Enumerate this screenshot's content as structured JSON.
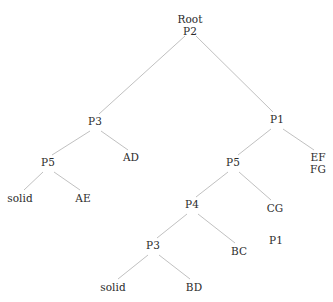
{
  "diagram": {
    "type": "tree",
    "background_color": "#ffffff",
    "edge_color": "#b0b0b0",
    "text_color": "#2b2b2b",
    "width": 333,
    "height": 302
  },
  "nodes": [
    {
      "id": "root",
      "label": "Root",
      "label2": "P2",
      "x": 190,
      "y": 14,
      "kind": "root"
    },
    {
      "id": "p3-left",
      "label": "P3",
      "label2": "",
      "x": 95,
      "y": 116,
      "kind": "internal"
    },
    {
      "id": "p1-right",
      "label": "P1",
      "label2": "",
      "x": 277,
      "y": 114,
      "kind": "internal"
    },
    {
      "id": "p5-left",
      "label": "P5",
      "label2": "",
      "x": 48,
      "y": 157,
      "kind": "internal"
    },
    {
      "id": "ad-leaf",
      "label": "AD",
      "label2": "",
      "x": 131,
      "y": 152,
      "kind": "leaf"
    },
    {
      "id": "solid-left",
      "label": "solid",
      "label2": "",
      "x": 20,
      "y": 193,
      "kind": "leaf"
    },
    {
      "id": "ae-leaf",
      "label": "AE",
      "label2": "",
      "x": 83,
      "y": 193,
      "kind": "leaf"
    },
    {
      "id": "p5-right",
      "label": "P5",
      "label2": "",
      "x": 233,
      "y": 157,
      "kind": "internal"
    },
    {
      "id": "effg-leaf",
      "label": "EF",
      "label2": "FG",
      "x": 318,
      "y": 152,
      "kind": "leaf"
    },
    {
      "id": "p4-node",
      "label": "P4",
      "label2": "",
      "x": 192,
      "y": 199,
      "kind": "internal"
    },
    {
      "id": "cg-leaf",
      "label": "CG",
      "label2": "",
      "x": 275,
      "y": 203,
      "kind": "leaf"
    },
    {
      "id": "p3-lower",
      "label": "P3",
      "label2": "",
      "x": 153,
      "y": 240,
      "kind": "internal"
    },
    {
      "id": "bc-leaf",
      "label": "BC",
      "label2": "",
      "x": 239,
      "y": 246,
      "kind": "leaf"
    },
    {
      "id": "p1-floating",
      "label": "P1",
      "label2": "",
      "x": 276,
      "y": 235,
      "kind": "detached"
    },
    {
      "id": "solid-lower",
      "label": "solid",
      "label2": "",
      "x": 113,
      "y": 282,
      "kind": "leaf"
    },
    {
      "id": "bd-leaf",
      "label": "BD",
      "label2": "",
      "x": 194,
      "y": 282,
      "kind": "leaf"
    }
  ],
  "edges": [
    {
      "from": "root",
      "to": "p3-left",
      "x1": 185,
      "y1": 36,
      "x2": 99,
      "y2": 114
    },
    {
      "from": "root",
      "to": "p1-right",
      "x1": 196,
      "y1": 36,
      "x2": 273,
      "y2": 112
    },
    {
      "from": "p3-left",
      "to": "p5-left",
      "x1": 90,
      "y1": 131,
      "x2": 52,
      "y2": 155
    },
    {
      "from": "p3-left",
      "to": "ad-leaf",
      "x1": 101,
      "y1": 131,
      "x2": 128,
      "y2": 150
    },
    {
      "from": "p5-left",
      "to": "solid-left",
      "x1": 43,
      "y1": 172,
      "x2": 24,
      "y2": 190
    },
    {
      "from": "p5-left",
      "to": "ae-leaf",
      "x1": 54,
      "y1": 172,
      "x2": 80,
      "y2": 190
    },
    {
      "from": "p1-right",
      "to": "p5-right",
      "x1": 271,
      "y1": 129,
      "x2": 238,
      "y2": 155
    },
    {
      "from": "p1-right",
      "to": "effg-leaf",
      "x1": 283,
      "y1": 129,
      "x2": 314,
      "y2": 150
    },
    {
      "from": "p5-right",
      "to": "p4-node",
      "x1": 228,
      "y1": 172,
      "x2": 196,
      "y2": 197
    },
    {
      "from": "p5-right",
      "to": "cg-leaf",
      "x1": 239,
      "y1": 172,
      "x2": 271,
      "y2": 200
    },
    {
      "from": "p4-node",
      "to": "p3-lower",
      "x1": 187,
      "y1": 214,
      "x2": 157,
      "y2": 238
    },
    {
      "from": "p4-node",
      "to": "bc-leaf",
      "x1": 198,
      "y1": 214,
      "x2": 235,
      "y2": 243
    },
    {
      "from": "p3-lower",
      "to": "solid-lower",
      "x1": 148,
      "y1": 255,
      "x2": 118,
      "y2": 279
    },
    {
      "from": "p3-lower",
      "to": "bd-leaf",
      "x1": 159,
      "y1": 255,
      "x2": 190,
      "y2": 279
    }
  ]
}
